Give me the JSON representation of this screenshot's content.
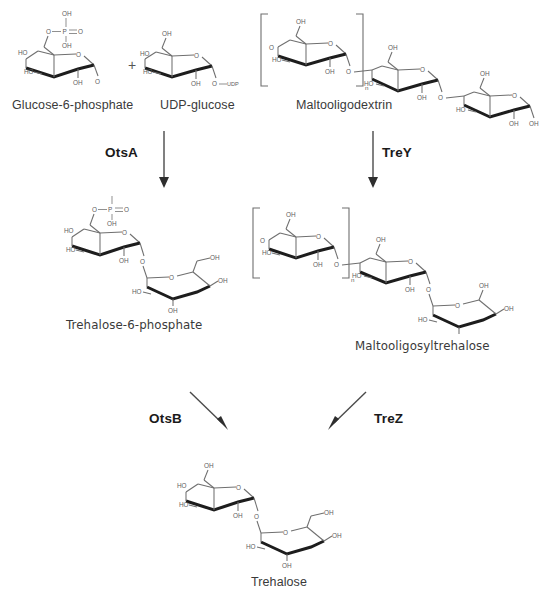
{
  "diagram": {
    "type": "biochemical-pathway"
  },
  "compounds": [
    {
      "id": "g6p",
      "label": "Glucose-6-phosphate"
    },
    {
      "id": "udpg",
      "label": "UDP-glucose"
    },
    {
      "id": "mod",
      "label": "Maltooligodextrin"
    },
    {
      "id": "t6p",
      "label": "Trehalose-6-phosphate"
    },
    {
      "id": "most",
      "label": "Maltooligosyltrehalose"
    },
    {
      "id": "treh",
      "label": "Trehalose"
    }
  ],
  "enzymes": [
    {
      "id": "otsa",
      "label": "OtsA"
    },
    {
      "id": "trey",
      "label": "TreY"
    },
    {
      "id": "otsb",
      "label": "OtsB"
    },
    {
      "id": "trez",
      "label": "TreZ"
    }
  ],
  "operators": {
    "plus": "+"
  },
  "atoms": {
    "oh": "OH",
    "ho": "HO",
    "o": "O",
    "p": "P",
    "udp": "UDP",
    "n": "n"
  },
  "colors": {
    "bond": "#6f6f6f",
    "bond_bold": "#1d1d1d",
    "atom_text": "#5d5d5d",
    "label_text": "#3a3a3a",
    "enzyme_text": "#1a1a1a",
    "background": "#ffffff"
  }
}
